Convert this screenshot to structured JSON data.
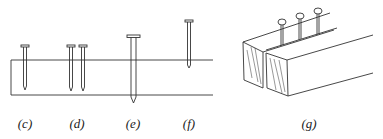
{
  "figure": {
    "stroke_color": "#333333",
    "background": "#ffffff",
    "panels": [
      {
        "id": "c",
        "label": "(c)",
        "label_x": 25,
        "description": "single nail driven partly through board"
      },
      {
        "id": "d",
        "label": "(d)",
        "label_x": 77,
        "description": "two nails side by side in board"
      },
      {
        "id": "e",
        "label": "(e)",
        "label_x": 133,
        "description": "long nail passing through board with tip protruding"
      },
      {
        "id": "f",
        "label": "(f)",
        "label_x": 189,
        "description": "short nail barely entering board"
      },
      {
        "id": "g",
        "label": "(g)",
        "label_x": 309,
        "description": "two wooden blocks joined with three nails along seam"
      }
    ]
  }
}
